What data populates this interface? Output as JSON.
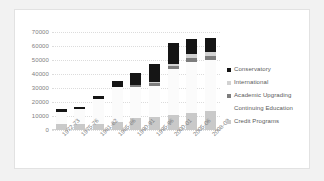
{
  "chart_data": {
    "type": "bar",
    "title": "",
    "subtitle": "",
    "xlabel": "",
    "ylabel": "",
    "stacked": true,
    "grid": true,
    "legend_position": "right",
    "ylim": [
      0,
      70000
    ],
    "ytick_labels": [
      "70000",
      "60000",
      "50000",
      "40000",
      "30000",
      "20000",
      "10000",
      "0"
    ],
    "ytick_values": [
      70000,
      60000,
      50000,
      40000,
      30000,
      20000,
      10000,
      0
    ],
    "categories": [
      "1972-73",
      "1975-76",
      "1981-82",
      "1985-86",
      "1990-91",
      "1995-96",
      "2000-01",
      "2005-06",
      "2008-09"
    ],
    "series": [
      {
        "name": "Credit Programs",
        "color": "#c9c9c9",
        "values": [
          4000,
          4200,
          4500,
          6000,
          8500,
          9000,
          11000,
          12500,
          13500
        ]
      },
      {
        "name": "Continuing Education",
        "color": "#fbfbfb",
        "values": [
          9000,
          10500,
          17500,
          25000,
          22000,
          22500,
          32500,
          36000,
          36500
        ]
      },
      {
        "name": "Academic Upgrading",
        "color": "#7d7d7d",
        "values": [
          0,
          0,
          0,
          0,
          1500,
          1800,
          2500,
          3000,
          3000
        ]
      },
      {
        "name": "International",
        "color": "#d2d2d2",
        "values": [
          0,
          0,
          0,
          0,
          500,
          700,
          1500,
          2500,
          2500
        ]
      },
      {
        "name": "Conservatory",
        "color": "#151515",
        "values": [
          2000,
          2000,
          2500,
          4000,
          8500,
          13000,
          15000,
          11000,
          10500
        ]
      }
    ],
    "totals": [
      15000,
      16700,
      24500,
      35000,
      41000,
      47000,
      62500,
      65000,
      66000
    ]
  },
  "legend": {
    "items": [
      {
        "label": "Conservatory",
        "color": "#151515",
        "swatch": true
      },
      {
        "label": "International",
        "color": "#d2d2d2",
        "swatch": true
      },
      {
        "label": "Academic Upgrading",
        "color": "#7d7d7d",
        "swatch": true
      },
      {
        "label": "Continuing Education",
        "color": "#fbfbfb",
        "swatch": false
      },
      {
        "label": "Credit Programs",
        "color": "#c9c9c9",
        "swatch": true
      }
    ]
  }
}
